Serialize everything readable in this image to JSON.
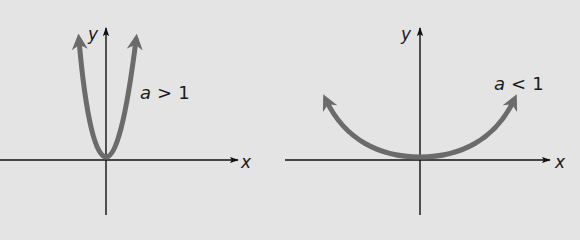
{
  "figure": {
    "background": "#e4e4e4",
    "curve_color": "#6b6b6b",
    "axis_color": "#111111",
    "graphs": [
      {
        "id": "left",
        "x_label": "x",
        "y_label": "y",
        "curve_label_var": "a",
        "curve_label_op": ">",
        "curve_label_val": "1",
        "description": "narrow parabola y = ax^2 opening upward"
      },
      {
        "id": "right",
        "x_label": "x",
        "y_label": "y",
        "curve_label_var": "a",
        "curve_label_op": "<",
        "curve_label_val": "1",
        "description": "wide parabola y = ax^2 opening upward"
      }
    ]
  }
}
